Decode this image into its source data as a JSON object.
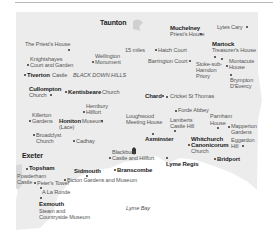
{
  "map": {
    "colors": {
      "land": "#ececec",
      "sea": "#ffffff",
      "text": "#222222",
      "subtext": "#555555",
      "rule": "#b8b8b8"
    },
    "labels": {
      "taunton": "Taunton",
      "muchelney": "Muchelney",
      "muchelney_sub": "Priest's House",
      "lytes_cary": "Lytes Cary",
      "priests_house": "The Priest's House",
      "hatch_court": "Hatch Court",
      "miles": "15 miles",
      "martock": "Martock",
      "martock_sub": "Treasurer's House",
      "knightshayes_1": "Knightshayes",
      "knightshayes_2": "Court and Garden",
      "wellington_1": "Wellington",
      "wellington_2": "Monument",
      "barrington": "Barrington Court",
      "stoke_1": "Stoke-sub-",
      "stoke_2": "Hamdon",
      "stoke_3": "Priory",
      "montacute_1": "Montacute",
      "montacute_2": "House",
      "tiverton": "Tiverton",
      "tiverton_sub": "Castle",
      "blackdown": "BLACK DOWN HILLS",
      "brympton_1": "Brympton",
      "brympton_2": "D'Evercy",
      "cullompton": "Cullompton",
      "cullompton_sub": "Church",
      "kentisbeare": "Kentisbeare",
      "kentisbeare_sub": "Church",
      "chard": "Chard",
      "cricket": "Cricket St Thomas",
      "hembury_1": "Hembury",
      "hembury_2": "Hillfort",
      "forde": "Forde Abbey",
      "killerton_1": "Killerton",
      "killerton_2": "Gardens",
      "honiton": "Honiton",
      "honiton_sub": "Museum",
      "lace": "(Lace)",
      "loughwood_1": "Loughwood",
      "loughwood_2": "Meeting House",
      "lamberts_1": "Lamberts",
      "lamberts_2": "Castle Hill",
      "parnham_1": "Parnham",
      "parnham_2": "House",
      "mapperton_1": "Mapperton",
      "mapperton_2": "Gardens",
      "broadclyst_1": "Broadclyst",
      "broadclyst_2": "Church",
      "cadhay": "Cadhay",
      "axminster": "Axminster",
      "whitchurch_1": "Whitchurch",
      "whitchurch_2": "Canonicorum",
      "whitchurch_3": "Church",
      "eggardon_1": "Eggardon",
      "eggardon_2": "Hill",
      "exeter": "Exeter",
      "blackbury_1": "Blackbury",
      "blackbury_2": "Castle and Hillfort",
      "lyme_regis": "Lyme Regis",
      "bridport": "Bridport",
      "topsham": "Topsham",
      "sidmouth": "Sidmouth",
      "branscombe": "Branscombe",
      "powderham_1": "Powderham",
      "powderham_2": "Castle",
      "peters_tower": "Peter's Tower",
      "bicton": "Bicton Gardens and Museum",
      "a_la_ronde": "A La Ronde",
      "exmouth": "Exmouth",
      "exmouth_sub_1": "Steam and",
      "exmouth_sub_2": "Countryside Museum",
      "lyme_bay": "Lyme Bay"
    }
  }
}
